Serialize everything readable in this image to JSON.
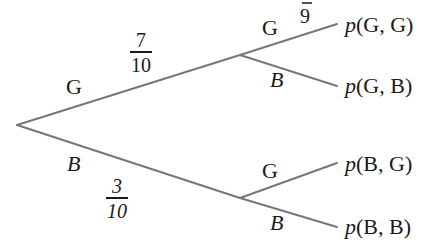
{
  "diagram": {
    "type": "probability-tree",
    "line_color": "#777777",
    "text_color": "#1a1a1a",
    "stage1": {
      "upper": {
        "label": "G",
        "prob_num": "7",
        "prob_den": "10"
      },
      "lower": {
        "label": "B",
        "prob_num": "3",
        "prob_den": "10"
      }
    },
    "stage2": {
      "after_G": {
        "upper": {
          "label": "G",
          "prob_partial": "9"
        },
        "lower": {
          "label": "B"
        }
      },
      "after_B": {
        "upper": {
          "label": "G"
        },
        "lower": {
          "label": "B"
        }
      }
    },
    "outcomes": [
      {
        "p": "p",
        "text": "(G, G)"
      },
      {
        "p": "p",
        "text": "(G, B)"
      },
      {
        "p": "p",
        "text": "(B, G)"
      },
      {
        "p": "p",
        "text": "(B, B)"
      }
    ]
  }
}
